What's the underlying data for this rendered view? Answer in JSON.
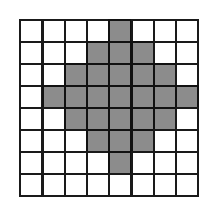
{
  "grid": {
    "rows": 8,
    "cols": 8,
    "filled_color": "#8c8c8c",
    "empty_color": "#ffffff",
    "line_color": "#1a1a1a",
    "cells": [
      [
        0,
        0,
        0,
        0,
        1,
        0,
        0,
        0
      ],
      [
        0,
        0,
        0,
        1,
        1,
        1,
        0,
        0
      ],
      [
        0,
        0,
        1,
        1,
        1,
        1,
        1,
        0
      ],
      [
        0,
        1,
        1,
        1,
        1,
        1,
        1,
        1
      ],
      [
        0,
        0,
        1,
        1,
        1,
        1,
        1,
        0
      ],
      [
        0,
        0,
        0,
        1,
        1,
        1,
        0,
        0
      ],
      [
        0,
        0,
        0,
        0,
        1,
        0,
        0,
        0
      ],
      [
        0,
        0,
        0,
        0,
        0,
        0,
        0,
        0
      ]
    ]
  }
}
